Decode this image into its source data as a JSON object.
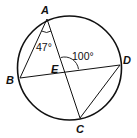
{
  "figure": {
    "type": "inscribed-angles-circle",
    "points": {
      "A": {
        "label": "A"
      },
      "B": {
        "label": "B"
      },
      "C": {
        "label": "C"
      },
      "D": {
        "label": "D"
      },
      "E": {
        "label": "E"
      }
    },
    "angles": {
      "angle_BAC": {
        "label": "47°"
      },
      "angle_AED": {
        "label": "100°"
      }
    },
    "segments": [
      "AB",
      "AC",
      "BD",
      "CD"
    ],
    "colors": {
      "stroke": "#111111",
      "background": "#ffffff"
    }
  }
}
